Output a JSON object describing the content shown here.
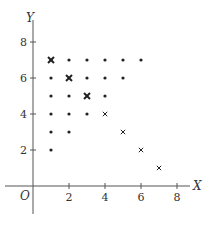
{
  "chart_data": {
    "type": "scatter",
    "title": "",
    "xlabel": "X",
    "ylabel": "Y",
    "origin_label": "O",
    "xlim": [
      -1.5,
      9.5
    ],
    "ylim": [
      -2,
      9
    ],
    "xticks": [
      2,
      4,
      6,
      8
    ],
    "yticks": [
      2,
      4,
      6,
      8
    ],
    "grid": false,
    "series": [
      {
        "name": "dots",
        "marker": "dot",
        "points": [
          [
            1,
            7
          ],
          [
            2,
            7
          ],
          [
            3,
            7
          ],
          [
            4,
            7
          ],
          [
            5,
            7
          ],
          [
            6,
            7
          ],
          [
            1,
            6
          ],
          [
            3,
            6
          ],
          [
            4,
            6
          ],
          [
            5,
            6
          ],
          [
            1,
            5
          ],
          [
            2,
            5
          ],
          [
            4,
            5
          ],
          [
            1,
            4
          ],
          [
            2,
            4
          ],
          [
            3,
            4
          ],
          [
            1,
            3
          ],
          [
            2,
            3
          ],
          [
            1,
            2
          ]
        ]
      },
      {
        "name": "bold-crosses",
        "marker": "bold-cross",
        "points": [
          [
            1,
            7
          ],
          [
            2,
            6
          ],
          [
            3,
            5
          ]
        ]
      },
      {
        "name": "crosses",
        "marker": "cross",
        "points": [
          [
            4,
            4
          ],
          [
            5,
            3
          ],
          [
            6,
            2
          ],
          [
            7,
            1
          ]
        ]
      }
    ]
  },
  "colors": {
    "axis": "#555555",
    "marker": "#222222"
  }
}
